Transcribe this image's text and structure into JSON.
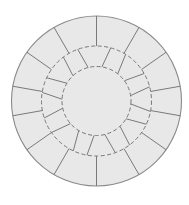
{
  "diagram": {
    "canvas": {
      "width": 189,
      "height": 205,
      "background": "#ffffff"
    },
    "center": {
      "x": 96.5,
      "y": 101
    },
    "colors": {
      "fill": "#e8e8e8",
      "outline": "#8a8a8a",
      "joint": "#7a7a7a",
      "dashed": "#777777"
    },
    "rings": {
      "outer_radius": 85,
      "middle_radius_dashed": 55,
      "inner_radius_dashed": 34.5
    },
    "outer_ring_joints_deg": [
      0,
      30,
      55,
      80,
      100,
      125,
      150,
      180,
      210,
      235,
      260,
      280,
      305,
      330
    ],
    "middle_ring_joints_deg": [
      12,
      35,
      57,
      78,
      98,
      118,
      140,
      163,
      187,
      208,
      232,
      255,
      276,
      298,
      320,
      343
    ],
    "middle_ring_joint_skew_deg": 6,
    "dash_pattern": "4 2.5"
  }
}
